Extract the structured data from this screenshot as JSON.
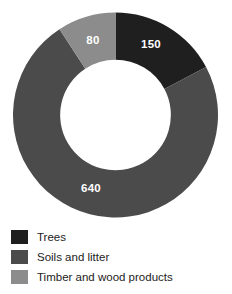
{
  "chart_data": {
    "type": "pie",
    "variant": "donut",
    "title": "",
    "subtitle": "",
    "xlabel": "",
    "ylabel": "",
    "total": 870,
    "units": "",
    "start_angle_deg": 0,
    "direction": "clockwise",
    "hole_ratio": 0.54,
    "grid": false,
    "legend_position": "bottom-left",
    "categories": [
      "Trees",
      "Soils and litter",
      "Timber and wood products"
    ],
    "values": [
      150,
      640,
      80
    ],
    "slices": [
      {
        "label": "Trees",
        "value": 150,
        "value_text": "150",
        "color": "#201f1f",
        "label_color": "#ffffff",
        "start_deg": 0,
        "sweep_deg": 62.07,
        "label_x": 151,
        "label_y": 45
      },
      {
        "label": "Soils and litter",
        "value": 640,
        "value_text": "640",
        "color": "#4b4b4b",
        "label_color": "#ffffff",
        "start_deg": 62.07,
        "sweep_deg": 264.83,
        "label_x": 91,
        "label_y": 189
      },
      {
        "label": "Timber and wood products",
        "value": 80,
        "value_text": "80",
        "color": "#8c8c8c",
        "label_color": "#ffffff",
        "start_deg": 326.9,
        "sweep_deg": 33.1,
        "label_x": 93,
        "label_y": 41
      }
    ]
  },
  "legend": {
    "items": [
      {
        "label": "Trees",
        "color": "#201f1f"
      },
      {
        "label": "Soils and litter",
        "color": "#4b4b4b"
      },
      {
        "label": "Timber and wood products",
        "color": "#8c8c8c"
      }
    ]
  },
  "colors": {
    "background": "#ffffff",
    "trees": "#201f1f",
    "soils_and_litter": "#4b4b4b",
    "timber_and_wood_products": "#8c8c8c",
    "label_text": "#ffffff",
    "legend_text": "#1c1c1c"
  }
}
